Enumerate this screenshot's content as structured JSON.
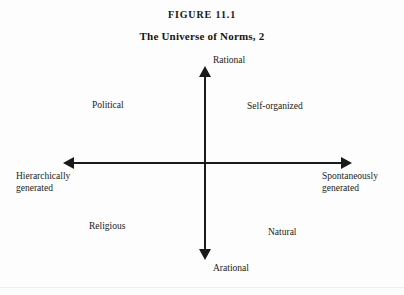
{
  "figure": {
    "number": "FIGURE 11.1",
    "title": "The Universe of Norms, 2"
  },
  "chart_data": {
    "type": "scatter",
    "title": "The Universe of Norms, 2",
    "axes": {
      "vertical": {
        "top_label": "Rational",
        "bottom_label": "Arational"
      },
      "horizontal": {
        "left_label": "Hierarchically generated",
        "right_label": "Spontaneously generated"
      }
    },
    "quadrant_labels": [
      {
        "quadrant": "upper-left",
        "label": "Political"
      },
      {
        "quadrant": "upper-right",
        "label": "Self-organized"
      },
      {
        "quadrant": "lower-left",
        "label": "Religious"
      },
      {
        "quadrant": "lower-right",
        "label": "Natural"
      }
    ]
  },
  "axis_labels": {
    "rational": "Rational",
    "arational": "Arational",
    "hierarchically_line1": "Hierarchically",
    "hierarchically_line2": "generated",
    "spontaneously_line1": "Spontaneously",
    "spontaneously_line2": "generated"
  },
  "quadrants": {
    "political": "Political",
    "self_organized": "Self-organized",
    "religious": "Religious",
    "natural": "Natural"
  },
  "colors": {
    "ink": "#1a1a1a",
    "paper": "#fdfdfd"
  }
}
